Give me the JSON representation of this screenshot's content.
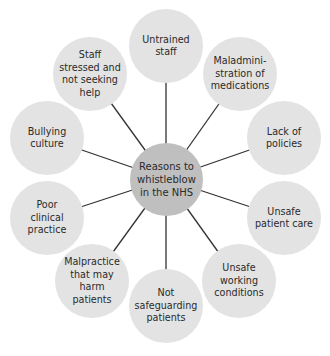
{
  "diagram": {
    "type": "mind-map",
    "center": {
      "label": "Reasons to\nwhistleblow\nin the NHS",
      "x": 166,
      "y": 179,
      "color": "#bfbfbf"
    },
    "node_color": "#e3e3e3",
    "line_color": "#333333",
    "nodes": [
      {
        "label": "Untrained\nstaff",
        "x": 166,
        "y": 46
      },
      {
        "label": "Maladmini-\nstration of\nmedications",
        "x": 240,
        "y": 74
      },
      {
        "label": "Lack of\npolicies",
        "x": 284,
        "y": 138
      },
      {
        "label": "Unsafe\npatient care",
        "x": 284,
        "y": 218
      },
      {
        "label": "Unsafe\nworking\nconditions",
        "x": 239,
        "y": 281
      },
      {
        "label": "Not\nsafeguarding\npatients",
        "x": 166,
        "y": 306
      },
      {
        "label": "Malpractice\nthat may\nharm patients",
        "x": 92,
        "y": 281
      },
      {
        "label": "Poor\nclinical\npractice",
        "x": 47,
        "y": 218
      },
      {
        "label": "Bullying\nculture",
        "x": 47,
        "y": 138
      },
      {
        "label": "Staff\nstressed and\nnot seeking\nhelp",
        "x": 90,
        "y": 74
      }
    ]
  }
}
